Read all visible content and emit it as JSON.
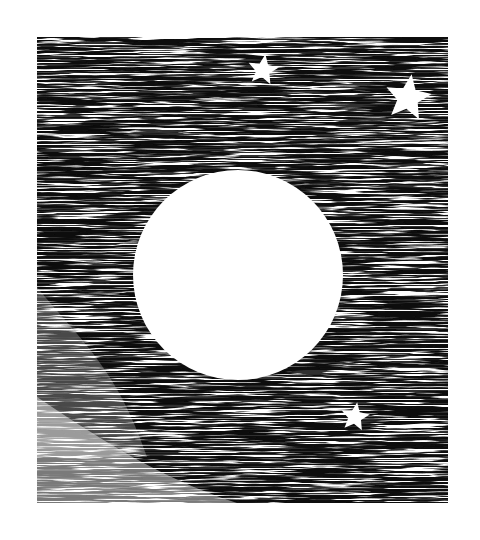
{
  "artwork": {
    "title": "Moon and stars engraving",
    "description": "Black-and-white scratchy horizontal hatching night sky with a large white full moon and three white five-pointed stars",
    "colors": {
      "ink": "#111111",
      "paper": "#ffffff"
    },
    "frame": {
      "x": 37,
      "y": 37,
      "width": 411,
      "height": 466
    },
    "moon": {
      "cx": 238,
      "cy": 275,
      "r": 105,
      "icon": "moon-icon"
    },
    "stars": [
      {
        "name": "star-top-center",
        "cx": 263,
        "cy": 70,
        "size": 32,
        "icon": "star-icon"
      },
      {
        "name": "star-top-right",
        "cx": 408,
        "cy": 98,
        "size": 48,
        "icon": "star-icon"
      },
      {
        "name": "star-bottom-right",
        "cx": 355,
        "cy": 417,
        "size": 30,
        "icon": "star-icon"
      }
    ]
  }
}
